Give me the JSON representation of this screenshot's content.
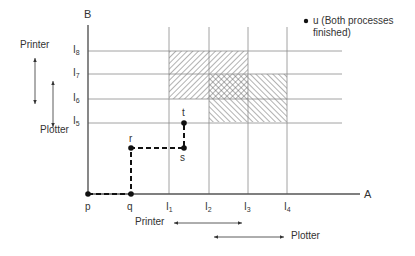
{
  "diagram": {
    "axes": {
      "x_label": "A",
      "y_label": "B"
    },
    "x_ticks": [
      {
        "main": "I",
        "sub": "1"
      },
      {
        "main": "I",
        "sub": "2"
      },
      {
        "main": "I",
        "sub": "3"
      },
      {
        "main": "I",
        "sub": "4"
      }
    ],
    "y_ticks": [
      {
        "main": "I",
        "sub": "8"
      },
      {
        "main": "I",
        "sub": "7"
      },
      {
        "main": "I",
        "sub": "6"
      },
      {
        "main": "I",
        "sub": "5"
      }
    ],
    "path_points": {
      "p": "p",
      "q": "q",
      "r": "r",
      "s": "s",
      "t": "t"
    },
    "legend": {
      "u_line1": "u (Both processes",
      "u_line2": "finished)"
    },
    "resources_y": {
      "printer": "Printer",
      "plotter": "Plotter"
    },
    "resources_x": {
      "printer": "Printer",
      "plotter": "Plotter"
    },
    "regions": [
      {
        "name": "printer-region",
        "x_range": [
          "I1",
          "I3"
        ],
        "y_range": [
          "I6",
          "I8"
        ],
        "hatch": "forward-slash"
      },
      {
        "name": "plotter-region",
        "x_range": [
          "I2",
          "I4"
        ],
        "y_range": [
          "I5",
          "I7"
        ],
        "hatch": "back-slash"
      },
      {
        "name": "overlap-region",
        "x_range": [
          "I2",
          "I3"
        ],
        "y_range": [
          "I6",
          "I7"
        ],
        "hatch": "cross"
      }
    ],
    "colors": {
      "axis": "#555555",
      "grid": "#888888",
      "path": "#111111",
      "hatch": "#555555"
    }
  }
}
